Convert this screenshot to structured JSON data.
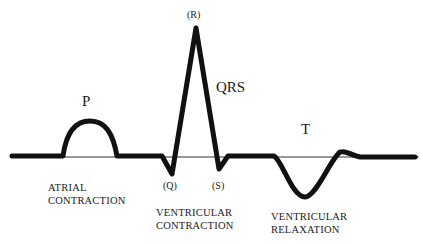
{
  "diagram": {
    "type": "ecg-waveform",
    "colors": {
      "trace": "#111111",
      "baseline": "#333333",
      "background": "#ffffff"
    },
    "waves": {
      "p": "P",
      "qrs": "QRS",
      "t": "T"
    },
    "points": {
      "q": "(Q)",
      "r": "(R)",
      "s": "(S)"
    },
    "phases": {
      "atrial": {
        "line1": "ATRIAL",
        "line2": "CONTRACTION"
      },
      "ventricular_contraction": {
        "line1": "VENTRICULAR",
        "line2": "CONTRACTION"
      },
      "ventricular_relaxation": {
        "line1": "VENTRICULAR",
        "line2": "RELAXATION"
      }
    }
  }
}
